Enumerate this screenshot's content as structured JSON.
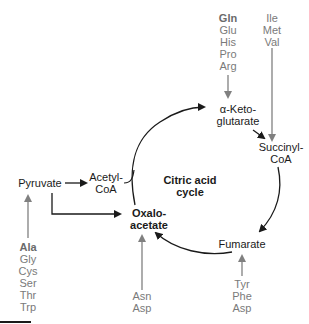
{
  "diagram": {
    "title": "Citric acid cycle",
    "center_label": [
      "Citric acid",
      "cycle"
    ],
    "nodes": {
      "pyruvate": "Pyruvate",
      "acetyl_coa": [
        "Acetyl-",
        "CoA"
      ],
      "oxaloacetate": [
        "Oxalo-",
        "acetate"
      ],
      "alpha_ketoglutarate": [
        "α-Keto-",
        "glutarate"
      ],
      "succinyl_coa": [
        "Succinyl-",
        "CoA"
      ],
      "fumarate": "Fumarate"
    },
    "amino_acid_groups": {
      "to_alpha_ketoglutarate": [
        "Gln",
        "Glu",
        "His",
        "Pro",
        "Arg"
      ],
      "to_succinyl_coa": [
        "Ile",
        "Met",
        "Val"
      ],
      "to_pyruvate": [
        "Ala",
        "Gly",
        "Cys",
        "Ser",
        "Thr",
        "Trp"
      ],
      "to_oxaloacetate": [
        "Asn",
        "Asp"
      ],
      "to_fumarate": [
        "Tyr",
        "Phe",
        "Asp"
      ]
    },
    "bold_entries": [
      "Gln",
      "Ala",
      "Oxalo-acetate",
      "Citric acid cycle"
    ],
    "colors": {
      "main_arrow": "#1a1a1a",
      "amino_acid_arrow": "#808080",
      "amino_acid_text": "#7a7a7a"
    }
  }
}
